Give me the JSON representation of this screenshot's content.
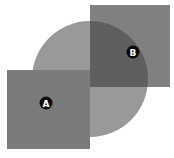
{
  "diagram": {
    "shapes": {
      "square_a": {
        "x": 7,
        "y": 70,
        "w": 83,
        "h": 79,
        "color": "#7b7b7b"
      },
      "circle": {
        "cx": 90,
        "cy": 79,
        "r": 58,
        "color": "#999999"
      },
      "square_b": {
        "x": 90,
        "y": 5,
        "w": 80,
        "h": 82,
        "color": "#808080"
      },
      "overlap_color": "#5f5f5f"
    },
    "markers": [
      {
        "label": "A",
        "cx": 46,
        "cy": 103
      },
      {
        "label": "B",
        "cx": 133,
        "cy": 52
      }
    ],
    "marker_color": "#0a0a0a",
    "marker_text_color": "#ffffff"
  }
}
